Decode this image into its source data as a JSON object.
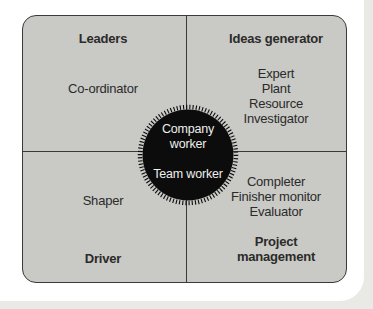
{
  "diagram": {
    "type": "quadrant-diagram",
    "quadrants": {
      "top_left": {
        "title": "Leaders",
        "items": [
          "Co-ordinator"
        ]
      },
      "top_right": {
        "title": "Ideas generator",
        "items": [
          "Expert",
          "Plant",
          "Resource",
          "Investigator"
        ]
      },
      "bottom_left": {
        "title": "Driver",
        "items": [
          "Shaper"
        ]
      },
      "bottom_right": {
        "title": "Project management",
        "items": [
          "Completer",
          "Finisher monitor",
          "Evaluator"
        ]
      }
    },
    "center": {
      "line1": "Company worker",
      "line2": "Team worker"
    },
    "colors": {
      "page_bg": "#e9e9e6",
      "paper": "#ffffff",
      "card_bg": "#c9c9c6",
      "line": "#3a3a38",
      "text": "#2b2b29",
      "circle_fill": "#0c0c0c",
      "circle_text": "#efefec"
    }
  }
}
